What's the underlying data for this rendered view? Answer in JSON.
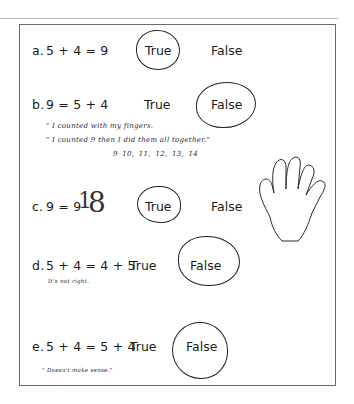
{
  "worksheet": {
    "options": {
      "true_label": "True",
      "false_label": "False"
    },
    "items": [
      {
        "label": "a.",
        "equation": "5 + 4 = 9",
        "circled": "True",
        "notes": []
      },
      {
        "label": "b.",
        "equation": "9 = 5 + 4",
        "circled": "False",
        "notes": [
          "\" I counted with my fingers.",
          "\" I counted 9 then I did them all together.\"",
          "9    10, 11, 12, 13, 14"
        ]
      },
      {
        "label": "c.",
        "equation": "9 = 9",
        "handwritten_edit": [
          "1",
          "8"
        ],
        "circled": "True",
        "notes": [],
        "drawing": "hand-outline"
      },
      {
        "label": "d.",
        "equation": "5 + 4 = 4 + 5",
        "circled": "False",
        "notes": [
          "It's not right."
        ]
      },
      {
        "label": "e.",
        "equation": "5 + 4 = 5 + 4",
        "circled": "False",
        "notes": [
          "\" Doesn't make sense.\""
        ]
      }
    ]
  }
}
